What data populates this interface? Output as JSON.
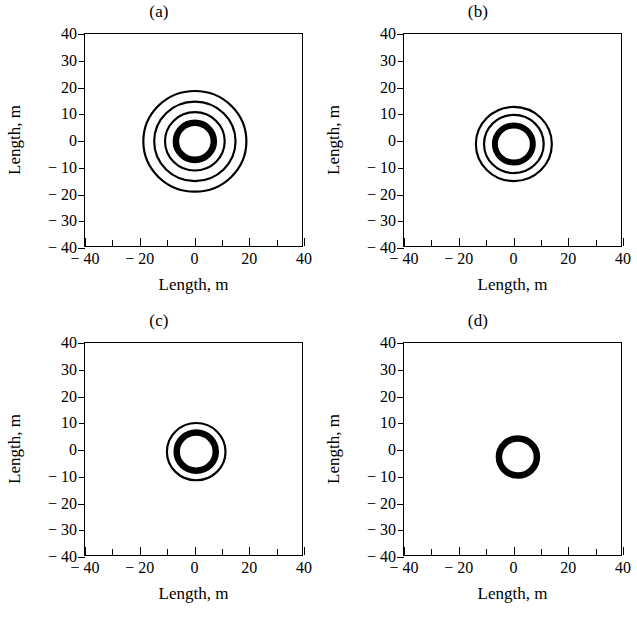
{
  "figure": {
    "background": "#ffffff",
    "ink": "#000000",
    "panel_count": 4
  },
  "axes_common": {
    "xlabel": "Length, m",
    "ylabel": "Length, m",
    "xlim": [
      -40,
      40
    ],
    "ylim": [
      -40,
      40
    ],
    "major_xticks": [
      -40,
      -20,
      0,
      20,
      40
    ],
    "minor_xticks": [
      -30,
      -10,
      10,
      30
    ],
    "xtick_labels": [
      "− 40",
      "− 20",
      "0",
      "20",
      "40"
    ],
    "yticks": [
      40,
      30,
      20,
      10,
      0,
      -10,
      -20,
      -30,
      -40
    ],
    "ytick_labels": [
      "40",
      "30",
      "20",
      "10",
      "0",
      "− 10",
      "− 20",
      "− 30",
      "− 40"
    ],
    "grid": false,
    "legend": "none",
    "tick_direction_x": "in",
    "tick_direction_y": "out"
  },
  "chart_data": [
    {
      "type": "line",
      "panel": "a",
      "title": "(a)",
      "xlabel": "Length, m",
      "ylabel": "Length, m",
      "xlim": [
        -40,
        40
      ],
      "ylim": [
        -40,
        40
      ],
      "grid": false,
      "legend": "none",
      "description": "concentric closed contour rings centred near the origin",
      "contours": [
        {
          "cx": 0.5,
          "cy": -0.5,
          "r": 7.0,
          "stroke_m": 2.4
        },
        {
          "cx": 0.5,
          "cy": -0.5,
          "r": 11.0,
          "stroke_m": 0.8
        },
        {
          "cx": 0.5,
          "cy": -0.5,
          "r": 15.0,
          "stroke_m": 0.8
        },
        {
          "cx": 0.5,
          "cy": -0.5,
          "r": 19.0,
          "stroke_m": 0.8
        }
      ]
    },
    {
      "type": "line",
      "panel": "b",
      "title": "(b)",
      "xlabel": "Length, m",
      "ylabel": "Length, m",
      "xlim": [
        -40,
        40
      ],
      "ylim": [
        -40,
        40
      ],
      "grid": false,
      "legend": "none",
      "description": "concentric closed contour rings centred near the origin",
      "contours": [
        {
          "cx": 0.5,
          "cy": -1.5,
          "r": 7.0,
          "stroke_m": 2.2
        },
        {
          "cx": 0.5,
          "cy": -1.5,
          "r": 11.0,
          "stroke_m": 0.8
        },
        {
          "cx": 0.5,
          "cy": -1.5,
          "r": 14.0,
          "stroke_m": 0.8
        }
      ]
    },
    {
      "type": "line",
      "panel": "c",
      "title": "(c)",
      "xlabel": "Length, m",
      "ylabel": "Length, m",
      "xlim": [
        -40,
        40
      ],
      "ylim": [
        -40,
        40
      ],
      "grid": false,
      "legend": "none",
      "description": "concentric closed contour rings centred near the origin",
      "contours": [
        {
          "cx": 1.0,
          "cy": -1.0,
          "r": 7.2,
          "stroke_m": 2.4
        },
        {
          "cx": 1.0,
          "cy": -1.0,
          "r": 10.8,
          "stroke_m": 0.8
        }
      ]
    },
    {
      "type": "line",
      "panel": "d",
      "title": "(d)",
      "xlabel": "Length, m",
      "ylabel": "Length, m",
      "xlim": [
        -40,
        40
      ],
      "ylim": [
        -40,
        40
      ],
      "grid": false,
      "legend": "none",
      "description": "single closed contour ring slightly below the origin",
      "contours": [
        {
          "cx": 2.0,
          "cy": -3.0,
          "r": 7.0,
          "stroke_m": 2.4
        }
      ]
    }
  ]
}
